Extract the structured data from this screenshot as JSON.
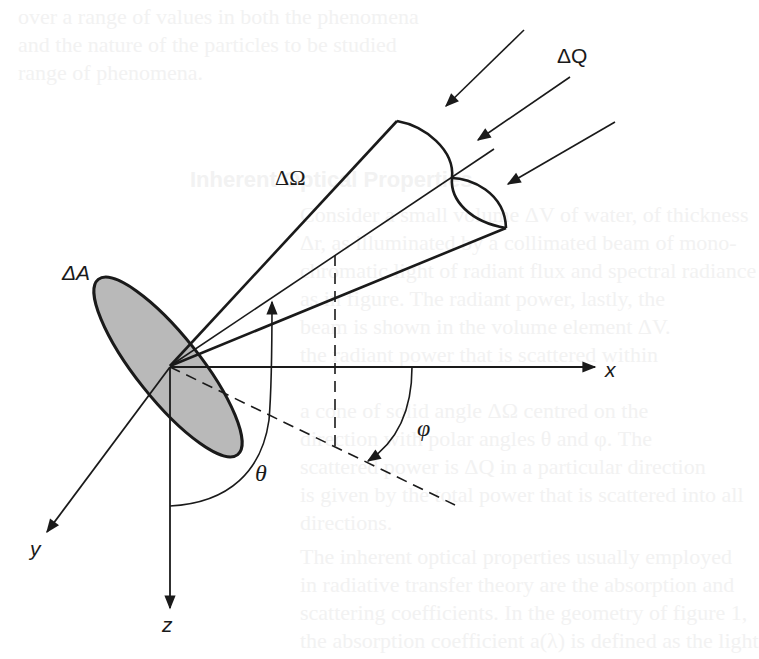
{
  "figure": {
    "type": "solid-angle-scattering-geometry",
    "colors": {
      "stroke": "#1a1a1a",
      "area_fill": "#b9b9b9",
      "background": "#ffffff",
      "bleed_text": "#f2f2f2"
    },
    "labels": {
      "delta_q": "ΔQ",
      "delta_omega": "ΔΩ",
      "delta_a": "ΔA",
      "axis_x": "x",
      "axis_y": "y",
      "axis_z": "z",
      "theta": "θ",
      "phi": "φ"
    },
    "incident_arrows": 3
  },
  "bleed_through": {
    "lines": [
      "over a range of values in both the phenomena",
      "and the nature of the particles to be studied",
      "range of phenomena.",
      "Inherent Optical Properties",
      "Consider a small volume ΔV of water, of thickness",
      "Δr, as illuminated by a collimated beam of mono-",
      "chromatic light of radiant flux and spectral radiance",
      "as in figure. The radiant power, lastly, the",
      "beam is shown in the volume element ΔV.",
      "the radiant power that is scattered within",
      "a cone of solid angle ΔΩ centred on the",
      "direction with polar angles θ and φ. The",
      "scattered power is ΔQ in a particular direction",
      "is given by the total power that is scattered into all",
      "directions.",
      "The inherent optical properties usually employed",
      "in radiative transfer theory are the absorption and",
      "scattering coefficients. In the geometry of figure 1,",
      "the absorption coefficient a(λ) is defined as the light"
    ]
  }
}
